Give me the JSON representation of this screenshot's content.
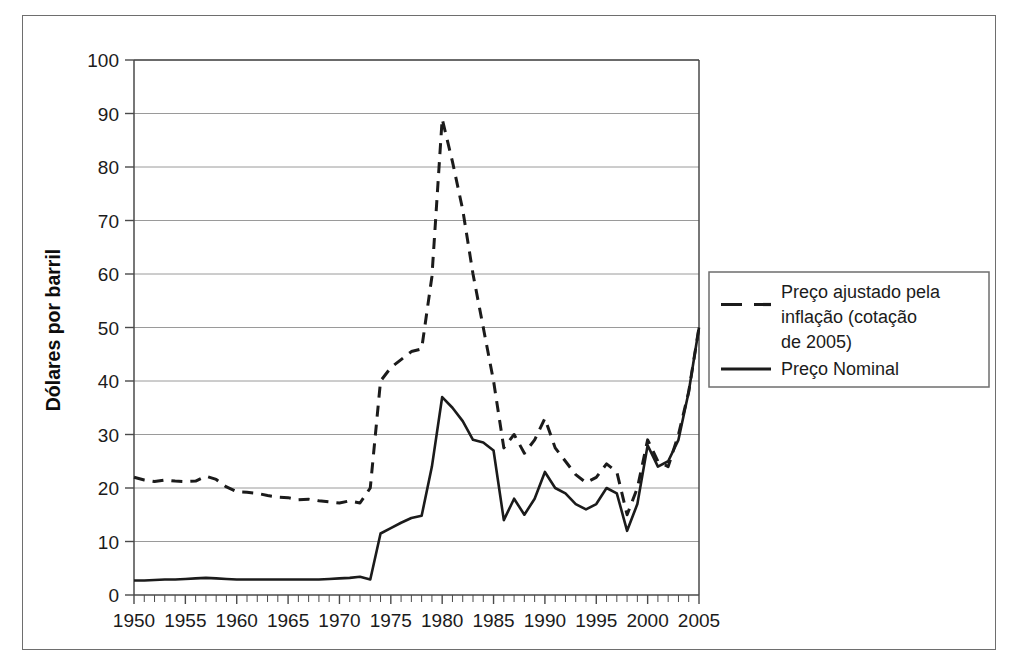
{
  "chart_data": {
    "type": "line",
    "title": "",
    "xlabel": "",
    "ylabel": "Dólares por barril",
    "xlim": [
      1950,
      2005
    ],
    "ylim": [
      0,
      100
    ],
    "grid": true,
    "grid_axis": "y",
    "legend_position": "right-outside",
    "x_tick_labels": [
      "1950",
      "1955",
      "1960",
      "1965",
      "1970",
      "1975",
      "1980",
      "1985",
      "1990",
      "1995",
      "2000",
      "2005"
    ],
    "x_tick_values": [
      1950,
      1955,
      1960,
      1965,
      1970,
      1975,
      1980,
      1985,
      1990,
      1995,
      2000,
      2005
    ],
    "x_minor_tick_step": 1,
    "y_tick_labels": [
      "0",
      "10",
      "20",
      "30",
      "40",
      "50",
      "60",
      "70",
      "80",
      "90",
      "100"
    ],
    "y_tick_values": [
      0,
      10,
      20,
      30,
      40,
      50,
      60,
      70,
      80,
      90,
      100
    ],
    "x": [
      1950,
      1951,
      1952,
      1953,
      1954,
      1955,
      1956,
      1957,
      1958,
      1959,
      1960,
      1961,
      1962,
      1963,
      1964,
      1965,
      1966,
      1967,
      1968,
      1969,
      1970,
      1971,
      1972,
      1973,
      1974,
      1975,
      1976,
      1977,
      1978,
      1979,
      1980,
      1981,
      1982,
      1983,
      1984,
      1985,
      1986,
      1987,
      1988,
      1989,
      1990,
      1991,
      1992,
      1993,
      1994,
      1995,
      1996,
      1997,
      1998,
      1999,
      2000,
      2001,
      2002,
      2003,
      2004,
      2005
    ],
    "series": [
      {
        "name": "Preço ajustado pela inflação (cotação de 2005)",
        "style": "dashed",
        "color": "#1b1b1b",
        "values": [
          22.0,
          21.5,
          21.2,
          21.5,
          21.3,
          21.2,
          21.3,
          22.2,
          21.6,
          20.2,
          19.3,
          19.2,
          19.0,
          18.6,
          18.3,
          18.2,
          17.8,
          17.9,
          17.6,
          17.4,
          17.2,
          17.6,
          17.2,
          20.0,
          40.0,
          42.5,
          44.0,
          45.5,
          46.0,
          59.5,
          89.0,
          81.0,
          72.0,
          60.0,
          50.0,
          40.0,
          27.5,
          30.0,
          26.5,
          29.0,
          33.0,
          27.5,
          25.0,
          22.5,
          21.0,
          22.0,
          24.5,
          23.0,
          15.0,
          20.0,
          29.0,
          25.0,
          24.0,
          30.0,
          38.0,
          50.0
        ]
      },
      {
        "name": "Preço Nominal",
        "style": "solid",
        "color": "#1b1b1b",
        "values": [
          2.7,
          2.7,
          2.8,
          2.9,
          2.9,
          3.0,
          3.1,
          3.2,
          3.1,
          3.0,
          2.9,
          2.9,
          2.9,
          2.9,
          2.9,
          2.9,
          2.9,
          2.9,
          2.9,
          3.0,
          3.1,
          3.2,
          3.4,
          2.9,
          11.5,
          12.5,
          13.5,
          14.4,
          14.8,
          24.0,
          37.0,
          35.0,
          32.5,
          29.0,
          28.5,
          27.0,
          14.0,
          18.0,
          15.0,
          18.0,
          23.0,
          20.0,
          19.0,
          17.0,
          16.0,
          17.0,
          20.0,
          19.0,
          12.0,
          17.0,
          28.0,
          24.0,
          25.0,
          29.0,
          38.0,
          50.0
        ]
      }
    ]
  },
  "legend": {
    "entries": [
      {
        "label_lines": [
          "Preço ajustado pela",
          "inflação (cotação",
          "de 2005)"
        ],
        "style": "dashed"
      },
      {
        "label_lines": [
          "Preço Nominal"
        ],
        "style": "solid"
      }
    ]
  },
  "colors": {
    "line": "#1b1b1b",
    "grid": "#8f8f8f",
    "axis": "#4a4a4a",
    "frame": "#6e6e6e",
    "background": "#ffffff"
  }
}
